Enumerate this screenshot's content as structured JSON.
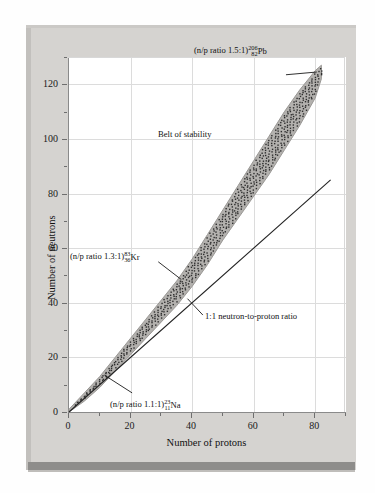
{
  "figure": {
    "background_color": "#d5d3d0",
    "plot_background": "#ffffff",
    "belt_fill": "#b3b1ae",
    "accent_bar_color": "#8e8d8b"
  },
  "chart_data": {
    "type": "scatter",
    "title": "",
    "xlabel": "Number of protons",
    "ylabel": "Number of neutrons",
    "xlim": [
      0,
      90
    ],
    "ylim": [
      0,
      130
    ],
    "xticks": [
      0,
      20,
      40,
      60,
      80
    ],
    "yticks": [
      0,
      20,
      40,
      60,
      80,
      100,
      120
    ],
    "xminor_step": 10,
    "yminor_step": 10,
    "grid": true,
    "grid_step": 20,
    "legend": "none",
    "series": [
      {
        "name": "Belt of stability",
        "kind": "band",
        "description": "Shaded band of stable nuclides, stippled with dots, widening from the origin to the lead tip",
        "lower_edge": [
          [
            0,
            0
          ],
          [
            5,
            4
          ],
          [
            10,
            9
          ],
          [
            15,
            15
          ],
          [
            20,
            21
          ],
          [
            25,
            27
          ],
          [
            30,
            33
          ],
          [
            35,
            39
          ],
          [
            40,
            46
          ],
          [
            45,
            54
          ],
          [
            50,
            63
          ],
          [
            55,
            71
          ],
          [
            60,
            79
          ],
          [
            65,
            87
          ],
          [
            70,
            96
          ],
          [
            75,
            105
          ],
          [
            80,
            115
          ],
          [
            82,
            122
          ]
        ],
        "upper_edge": [
          [
            0,
            1
          ],
          [
            5,
            7
          ],
          [
            10,
            13
          ],
          [
            15,
            20
          ],
          [
            20,
            27
          ],
          [
            25,
            34
          ],
          [
            30,
            41
          ],
          [
            35,
            48
          ],
          [
            40,
            56
          ],
          [
            45,
            65
          ],
          [
            50,
            74
          ],
          [
            55,
            83
          ],
          [
            60,
            92
          ],
          [
            65,
            101
          ],
          [
            70,
            110
          ],
          [
            75,
            118
          ],
          [
            80,
            125
          ],
          [
            82,
            127
          ]
        ]
      },
      {
        "name": "1:1 neutron-to-proton ratio",
        "kind": "line",
        "points": [
          [
            0,
            0
          ],
          [
            85,
            85
          ]
        ]
      }
    ],
    "annotations": [
      {
        "name": "lead-label",
        "text_prefix": "(n/p ratio 1.5:1)",
        "mass_number": "206",
        "atomic_number": "82",
        "symbol": "Pb",
        "points_to": [
          82,
          125
        ]
      },
      {
        "name": "krypton-label",
        "text_prefix": "(n/p ratio 1.3:1)",
        "mass_number": "83",
        "atomic_number": "36",
        "symbol": "Kr",
        "points_to": [
          36,
          47
        ]
      },
      {
        "name": "sodium-label",
        "text_prefix": "(n/p ratio 1.1:1)",
        "mass_number": "23",
        "atomic_number": "11",
        "symbol": "Na",
        "points_to": [
          11,
          12
        ]
      },
      {
        "name": "belt-of-stability-label",
        "text_prefix": "Belt of stability",
        "mass_number": "",
        "atomic_number": "",
        "symbol": "",
        "points_to": null
      },
      {
        "name": "one-to-one-ratio-label",
        "text_prefix": "1:1 neutron-to-proton ratio",
        "mass_number": "",
        "atomic_number": "",
        "symbol": "",
        "points_to": [
          40,
          40
        ]
      }
    ]
  },
  "labels": {
    "x_axis_title": "Number of protons",
    "y_axis_title": "Number of neutrons",
    "belt": "Belt of stability",
    "ratio_line": "1:1 neutron-to-proton ratio",
    "pb_prefix": "(n/p ratio 1.5:1)",
    "pb_mass": "206",
    "pb_z": "82",
    "pb_symbol": "Pb",
    "kr_prefix": "(n/p ratio 1.3:1)",
    "kr_mass": "83",
    "kr_z": "36",
    "kr_symbol": "Kr",
    "na_prefix": "(n/p ratio 1.1:1)",
    "na_mass": "23",
    "na_z": "11",
    "na_symbol": "Na"
  },
  "xticklabels": [
    "0",
    "20",
    "40",
    "60",
    "80"
  ],
  "yticklabels": [
    "0",
    "20",
    "40",
    "60",
    "80",
    "100",
    "120"
  ]
}
